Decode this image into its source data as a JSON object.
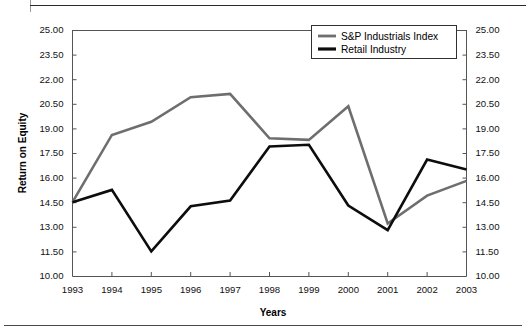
{
  "chart_data": {
    "type": "line",
    "title": "",
    "xlabel": "Years",
    "ylabel": "Return on Equity",
    "categories": [
      "1993",
      "1994",
      "1995",
      "1996",
      "1997",
      "1998",
      "1999",
      "2000",
      "2001",
      "2002",
      "2003"
    ],
    "ylim": [
      10.0,
      25.0
    ],
    "ytick_step": 1.5,
    "yticks": [
      "10.00",
      "11.50",
      "13.00",
      "14.50",
      "16.00",
      "17.50",
      "19.00",
      "20.50",
      "22.00",
      "23.50",
      "25.00"
    ],
    "grid": false,
    "dual_y_axis": true,
    "right_axis_same_as_left": true,
    "legend_position": "top-right",
    "series": [
      {
        "name": "S&P Industrials Index",
        "color": "#6e6e6e",
        "values": [
          14.5,
          18.6,
          19.4,
          20.9,
          21.1,
          18.4,
          18.3,
          20.35,
          13.2,
          14.9,
          15.8
        ]
      },
      {
        "name": "Retail Industry",
        "color": "#0d0d0d",
        "values": [
          14.5,
          15.25,
          11.5,
          14.25,
          14.6,
          17.9,
          18.0,
          14.3,
          12.8,
          17.1,
          16.5
        ]
      }
    ]
  },
  "legend": {
    "entries": [
      {
        "label": "S&P Industrials Index"
      },
      {
        "label": "Retail Industry"
      }
    ]
  },
  "axes": {
    "x_title": "Years",
    "y_title": "Return on Equity"
  }
}
